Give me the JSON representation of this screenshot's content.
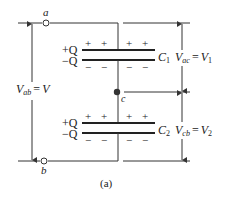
{
  "figure": {
    "caption": "(a)",
    "terminals": {
      "a": "a",
      "b": "b",
      "c": "c"
    },
    "capacitors": [
      {
        "name": "C",
        "subscript": "1",
        "plus_charge": "+Q",
        "minus_charge": "−Q",
        "voltage_label": {
          "lhs": "V",
          "lhs_sub": "ac",
          "rhs": "V",
          "rhs_sub": "1"
        }
      },
      {
        "name": "C",
        "subscript": "2",
        "plus_charge": "+Q",
        "minus_charge": "−Q",
        "voltage_label": {
          "lhs": "V",
          "lhs_sub": "cb",
          "rhs": "V",
          "rhs_sub": "2"
        }
      }
    ],
    "total_voltage": {
      "lhs": "V",
      "lhs_sub": "ab",
      "rhs": "V"
    },
    "plus_sign": "+",
    "minus_sign": "−",
    "equals": "="
  }
}
